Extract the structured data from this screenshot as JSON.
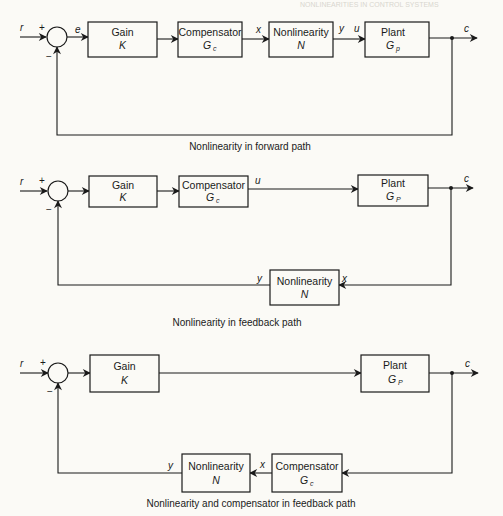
{
  "header": {
    "running_head": "NONLINEARITIES IN CONTROL SYSTEMS"
  },
  "diagrams": [
    {
      "caption": "Nonlinearity in forward path",
      "signals": {
        "r": "r",
        "e": "e",
        "x": "x",
        "y": "y",
        "u": "u",
        "c": "c"
      },
      "signs": {
        "plus": "+",
        "minus": "−"
      },
      "blocks": {
        "gain": {
          "name": "Gain",
          "symbol": "K"
        },
        "compensator": {
          "name": "Compensator",
          "symbol": "G",
          "sub": "c"
        },
        "nonlinearity": {
          "name": "Nonlinearity",
          "symbol": "N"
        },
        "plant": {
          "name": "Plant",
          "symbol": "G",
          "sub": "p"
        }
      }
    },
    {
      "caption": "Nonlinearity in feedback path",
      "signals": {
        "r": "r",
        "u": "u",
        "c": "c",
        "x": "x",
        "y": "y"
      },
      "signs": {
        "plus": "+",
        "minus": "−"
      },
      "blocks": {
        "gain": {
          "name": "Gain",
          "symbol": "K"
        },
        "compensator": {
          "name": "Compensator",
          "symbol": "G",
          "sub": "c"
        },
        "plant": {
          "name": "Plant",
          "symbol": "G",
          "sub": "P"
        },
        "nonlinearity": {
          "name": "Nonlinearity",
          "symbol": "N"
        }
      }
    },
    {
      "caption": "Nonlinearity and compensator in feedback path",
      "signals": {
        "r": "r",
        "c": "c",
        "x": "x",
        "y": "y"
      },
      "signs": {
        "plus": "+",
        "minus": "−"
      },
      "blocks": {
        "gain": {
          "name": "Gain",
          "symbol": "K"
        },
        "plant": {
          "name": "Plant",
          "symbol": "G",
          "sub": "P"
        },
        "nonlinearity": {
          "name": "Nonlinearity",
          "symbol": "N"
        },
        "compensator": {
          "name": "Compensator",
          "symbol": "G",
          "sub": "c"
        }
      }
    }
  ]
}
